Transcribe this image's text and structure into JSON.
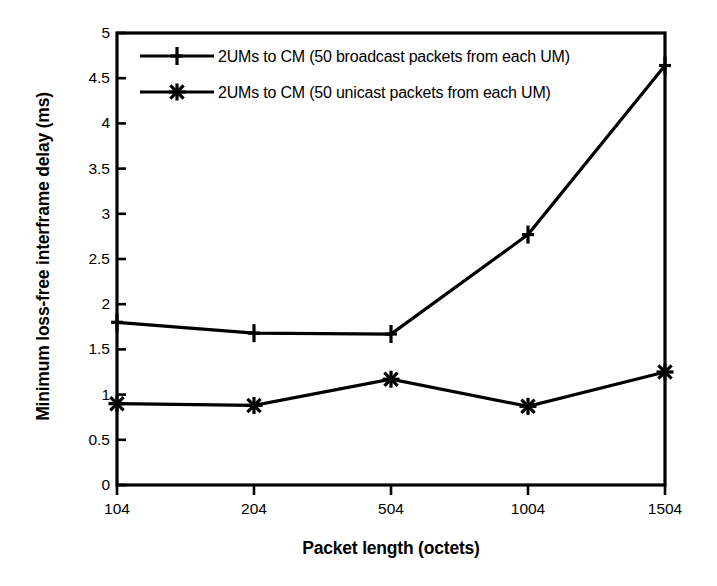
{
  "chart_data": {
    "type": "line",
    "title": "",
    "subtitle": "",
    "xlabel": "Packet length (octets)",
    "ylabel": "Minimum loss-free interframe delay (ms)",
    "categories": [
      "104",
      "204",
      "504",
      "1004",
      "1504"
    ],
    "x": [
      104,
      204,
      504,
      1004,
      1504
    ],
    "series": [
      {
        "name": "2UMs to CM (50 broadcast packets from each UM)",
        "marker": "plus",
        "color": "#000000",
        "values": [
          1.8,
          1.68,
          1.67,
          2.77,
          4.64
        ]
      },
      {
        "name": "2UMs to CM (50 unicast packets from each UM)",
        "marker": "asterisk",
        "color": "#000000",
        "values": [
          0.9,
          0.88,
          1.17,
          0.87,
          1.25
        ]
      }
    ],
    "ylim": [
      0,
      5
    ],
    "yticks": [
      0,
      0.5,
      1,
      1.5,
      2,
      2.5,
      3,
      3.5,
      4,
      4.5,
      5
    ],
    "ytick_labels": [
      "0",
      "0.5",
      "1",
      "1.5",
      "2",
      "2.5",
      "3",
      "3.5",
      "4",
      "4.5",
      "5"
    ],
    "xtick_labels": [
      "104",
      "204",
      "504",
      "1004",
      "1504"
    ],
    "grid": false,
    "legend_position": "top-left-inside",
    "frame": "box",
    "line_color": "#000000",
    "background_color": "#ffffff"
  },
  "legend": {
    "entries": [
      {
        "label": "2UMs to CM (50 broadcast packets from each UM)"
      },
      {
        "label": "2UMs to CM (50 unicast packets from each UM)"
      }
    ]
  }
}
